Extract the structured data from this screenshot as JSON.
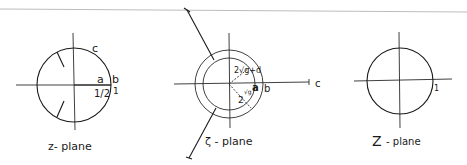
{
  "figure": {
    "top_rule": {
      "visible": true,
      "color": "#bdbdbd"
    },
    "panels": [
      {
        "id": "z-plane",
        "caption": "z- plane",
        "labels": {
          "c": "c",
          "a": "a",
          "b": "b",
          "half": "1/2",
          "one": "1"
        }
      },
      {
        "id": "zeta-plane",
        "caption": "ζ - plane",
        "labels": {
          "inner_radius": "2√g+d",
          "outer_radius": "2",
          "inner_radius_sub": "√g",
          "a": "a",
          "b": "b",
          "c": "c"
        }
      },
      {
        "id": "Z-plane",
        "caption": "Z",
        "caption_suffix": "- plane",
        "labels": {
          "one": "1"
        }
      }
    ]
  }
}
